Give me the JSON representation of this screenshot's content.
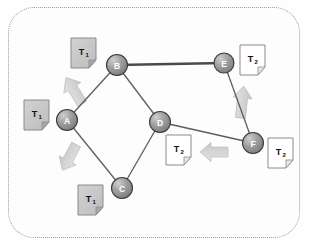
{
  "diagram": {
    "frame_style": "dotted-rounded-rectangle",
    "colors": {
      "node_fill": "#8f8f8f",
      "node_highlight": "#c9c9c9",
      "node_stroke": "#3a3a3a",
      "node_label": "#ffffff",
      "edge": "#5a5a5a",
      "edge_thick": "#4a4a4a",
      "doc_t1_fill": "#c6c6c6",
      "doc_t2_fill": "#ffffff",
      "doc_stroke": "#8a8a8a",
      "arrow_fill": "#d8d8d8",
      "arrow_stroke": "#c2c2c2",
      "frame_border": "#9a9a9a",
      "background": "#fdfdfd"
    },
    "nodes": [
      {
        "id": "A",
        "label": "A",
        "cx": 67,
        "cy": 120,
        "r": 10.5
      },
      {
        "id": "B",
        "label": "B",
        "cx": 117,
        "cy": 65,
        "r": 10.5
      },
      {
        "id": "C",
        "label": "C",
        "cx": 122,
        "cy": 188,
        "r": 10.5
      },
      {
        "id": "D",
        "label": "D",
        "cx": 160,
        "cy": 122,
        "r": 10.5
      },
      {
        "id": "E",
        "label": "E",
        "cx": 224,
        "cy": 63,
        "r": 10.0
      },
      {
        "id": "F",
        "label": "F",
        "cx": 253,
        "cy": 143,
        "r": 10.5
      }
    ],
    "edges": [
      {
        "from": "A",
        "to": "B",
        "weight": "thin"
      },
      {
        "from": "A",
        "to": "C",
        "weight": "thin"
      },
      {
        "from": "B",
        "to": "D",
        "weight": "thin"
      },
      {
        "from": "B",
        "to": "E",
        "weight": "thick"
      },
      {
        "from": "C",
        "to": "D",
        "weight": "thin"
      },
      {
        "from": "D",
        "to": "F",
        "weight": "thin"
      },
      {
        "from": "E",
        "to": "F",
        "weight": "thin"
      }
    ],
    "documents": [
      {
        "id": "doc-a",
        "label": "T",
        "subscript": "1",
        "variant": "t1",
        "x": 24,
        "y": 100,
        "w": 25,
        "h": 30
      },
      {
        "id": "doc-b",
        "label": "T",
        "subscript": "1",
        "variant": "t1",
        "x": 71,
        "y": 38,
        "w": 25,
        "h": 30
      },
      {
        "id": "doc-c",
        "label": "T",
        "subscript": "1",
        "variant": "t1",
        "x": 78,
        "y": 185,
        "w": 25,
        "h": 30
      },
      {
        "id": "doc-d",
        "label": "T",
        "subscript": "2",
        "variant": "t2",
        "x": 166,
        "y": 135,
        "w": 25,
        "h": 30
      },
      {
        "id": "doc-e",
        "label": "T",
        "subscript": "2",
        "variant": "t2",
        "x": 240,
        "y": 45,
        "w": 25,
        "h": 30
      },
      {
        "id": "doc-f",
        "label": "T",
        "subscript": "2",
        "variant": "t2",
        "x": 268,
        "y": 138,
        "w": 25,
        "h": 30
      }
    ],
    "arrows": [
      {
        "id": "arrow-a-to-doc-b",
        "direction": "up-right",
        "cx": 75,
        "cy": 92,
        "angle": -32
      },
      {
        "id": "arrow-a-to-doc-c",
        "direction": "down-right",
        "cx": 70,
        "cy": 156,
        "angle": 28
      },
      {
        "id": "arrow-f-to-doc-d",
        "direction": "left",
        "cx": 215,
        "cy": 152,
        "angle": -90
      },
      {
        "id": "arrow-f-to-doc-e",
        "direction": "up",
        "cx": 242,
        "cy": 103,
        "angle": 6
      }
    ]
  }
}
